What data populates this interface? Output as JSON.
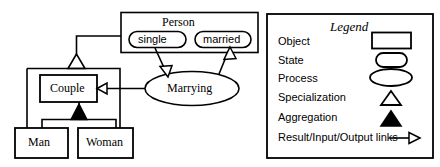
{
  "diagram": {
    "objects": {
      "person": {
        "label": "Person"
      },
      "couple": {
        "label": "Couple"
      },
      "man": {
        "label": "Man"
      },
      "woman": {
        "label": "Woman"
      }
    },
    "states": {
      "single": {
        "label": "single"
      },
      "married": {
        "label": "married"
      }
    },
    "processes": {
      "marrying": {
        "label": "Marrying"
      }
    },
    "relations": {
      "specialization": "Couple group specializes Person",
      "aggregation": "Couple aggregates Man and Woman",
      "input_link": "single -> Marrying",
      "output_link": "Marrying -> married",
      "result_link": "Marrying -> Couple"
    }
  },
  "legend": {
    "title": "Legend",
    "items": [
      {
        "label": "Object",
        "symbol": "rectangle-icon"
      },
      {
        "label": "State",
        "symbol": "rounded-rectangle-icon"
      },
      {
        "label": "Process",
        "symbol": "ellipse-icon"
      },
      {
        "label": "Specialization",
        "symbol": "hollow-triangle-icon"
      },
      {
        "label": "Aggregation",
        "symbol": "filled-triangle-icon"
      },
      {
        "label": "Result/Input/Output links",
        "symbol": "open-arrow-icon"
      }
    ]
  },
  "colors": {
    "stroke": "#000000",
    "fill": "#ffffff",
    "solid": "#000000"
  }
}
